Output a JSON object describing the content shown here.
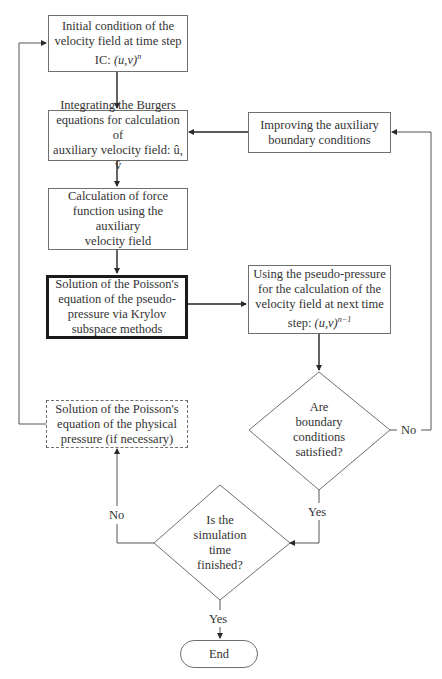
{
  "diagram": {
    "type": "flowchart",
    "nodes": {
      "initial_condition": {
        "line1": "Initial condition of the",
        "line2": "velocity field at time step",
        "line3_prefix": "IC: ",
        "line3_math": "(u,v)",
        "line3_sup": "n"
      },
      "burgers": {
        "line1": "Integrating the Burgers",
        "line2": "equations for calculation of",
        "line3": "auxiliary velocity field: û, v̂"
      },
      "improve_bc": {
        "line1": "Improving the auxiliary",
        "line2": "boundary conditions"
      },
      "force_function": {
        "line1": "Calculation of force",
        "line2": "function using the auxiliary",
        "line3": "velocity field"
      },
      "poisson_pseudo": {
        "line1": "Solution of the Poisson's",
        "line2": "equation of the pseudo-",
        "line3": "pressure via Krylov",
        "line4": "subspace methods"
      },
      "next_velocity": {
        "line1": "Using the pseudo-pressure",
        "line2": "for the calculation of the",
        "line3": "velocity field at next time",
        "line4_prefix": "step: ",
        "line4_math": "(u,v)",
        "line4_sup": "n−1"
      },
      "bc_decision": {
        "line1": "Are",
        "line2": "boundary",
        "line3": "conditions",
        "line4": "satisfied?"
      },
      "poisson_physical": {
        "line1": "Solution of the Poisson's",
        "line2": "equation of the physical",
        "line3": "pressure (if necessary)"
      },
      "time_decision": {
        "line1": "Is the",
        "line2": "simulation",
        "line3": "time",
        "line4": "finished?"
      },
      "end": {
        "label": "End"
      }
    },
    "edge_labels": {
      "bc_no": "No",
      "bc_yes": "Yes",
      "time_no": "No",
      "time_yes": "Yes"
    },
    "colors": {
      "line": "#555555",
      "border": "#6f6f6f",
      "bold_border": "#1a1a1a",
      "text": "#333333",
      "background": "#ffffff"
    }
  }
}
